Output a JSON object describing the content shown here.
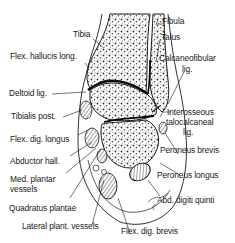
{
  "diagram": {
    "labels_left": [
      {
        "id": "tibia",
        "text": "Tibia"
      },
      {
        "id": "flex-hallucis-long",
        "text": "Flex. hallucis long."
      },
      {
        "id": "deltoid-lig",
        "text": "Deltoid lig."
      },
      {
        "id": "tibialis-post",
        "text": "Tibialis post."
      },
      {
        "id": "flex-dig-longus",
        "text": "Flex. dig. longus"
      },
      {
        "id": "abductor-hall",
        "text": "Abductor hall."
      },
      {
        "id": "med-plantar-vessels-1",
        "text": "Med. plantar"
      },
      {
        "id": "med-plantar-vessels-2",
        "text": "vessels"
      },
      {
        "id": "quadratus-plantae",
        "text": "Quadratus plantae"
      },
      {
        "id": "lateral-plant-vessels",
        "text": "Lateral plant. vessels"
      }
    ],
    "labels_right": [
      {
        "id": "fibula",
        "text": "Fibula"
      },
      {
        "id": "talus",
        "text": "Talus"
      },
      {
        "id": "calcaneofibular-lig-1",
        "text": "Calcaneofibular"
      },
      {
        "id": "calcaneofibular-lig-2",
        "text": "lig."
      },
      {
        "id": "interosseous-1",
        "text": "Interosseous"
      },
      {
        "id": "interosseous-2",
        "text": "talocalcaneal"
      },
      {
        "id": "interosseous-3",
        "text": "lig."
      },
      {
        "id": "peroneus-brevis",
        "text": "Peroneus brevis"
      },
      {
        "id": "peroneus-longus",
        "text": "Peroneus longus"
      },
      {
        "id": "abd-digiti-quinti",
        "text": "Abd. digiti quinti"
      },
      {
        "id": "flex-dig-brevis",
        "text": "Flex. dig. brevis"
      }
    ],
    "colors": {
      "ink": "#1a1a1a",
      "background": "#ffffff",
      "joint_line": "#000000"
    }
  }
}
